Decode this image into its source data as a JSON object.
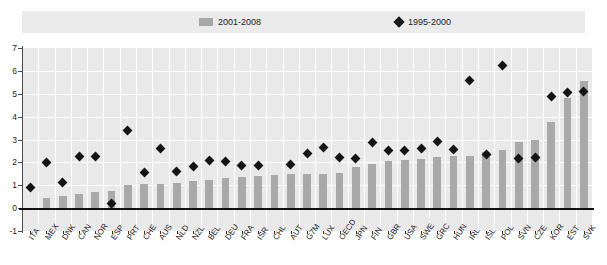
{
  "legend": {
    "items": [
      {
        "label": "2001-2008",
        "marker": "bar-swatch-icon",
        "color": "#a8a8a8"
      },
      {
        "label": "1995-2000",
        "marker": "diamond-icon",
        "color": "#1a1a1a"
      }
    ]
  },
  "chart_data": {
    "type": "bar",
    "title": "",
    "subtitle": "",
    "xlabel": "",
    "ylabel": "",
    "ylim": [
      -1,
      7
    ],
    "yticks": [
      -1,
      0,
      1,
      2,
      3,
      4,
      5,
      6,
      7
    ],
    "ytick_labels": [
      "-1",
      "0",
      "1",
      "2",
      "3",
      "4",
      "5",
      "6",
      "7"
    ],
    "grid": true,
    "legend_position": "top",
    "categories": [
      "ITA",
      "MEX",
      "DNK",
      "CAN",
      "NOR",
      "ESP",
      "PRT",
      "CHE",
      "AUS",
      "NLD",
      "NZL",
      "BEL",
      "DEU",
      "FRA",
      "ISR",
      "CHL",
      "AUT",
      "G7M",
      "LUX",
      "OECD",
      "JPN",
      "FIN",
      "GBR",
      "USA",
      "SWE",
      "GRC",
      "HUN",
      "IRL",
      "ISL",
      "POL",
      "SVN",
      "CZE",
      "KOR",
      "EST",
      "SVK"
    ],
    "series": [
      {
        "name": "2001-2008",
        "type": "bar",
        "color": "#a9a9a9",
        "values": [
          0.0,
          0.45,
          0.55,
          0.6,
          0.7,
          0.75,
          1.0,
          1.05,
          1.05,
          1.1,
          1.2,
          1.25,
          1.3,
          1.35,
          1.4,
          1.45,
          1.5,
          1.5,
          1.5,
          1.55,
          1.8,
          1.95,
          2.05,
          2.1,
          2.15,
          2.25,
          2.3,
          2.3,
          2.45,
          2.55,
          2.9,
          3.0,
          3.75,
          4.8,
          5.55
        ]
      },
      {
        "name": "1995-2000",
        "type": "scatter",
        "marker": "diamond",
        "color": "#141414",
        "values": [
          0.9,
          2.0,
          1.1,
          2.25,
          2.25,
          0.2,
          3.4,
          1.55,
          2.6,
          1.6,
          1.8,
          2.1,
          2.05,
          1.85,
          1.85,
          null,
          1.9,
          2.4,
          2.65,
          2.2,
          2.15,
          2.85,
          2.5,
          2.5,
          2.6,
          2.9,
          2.55,
          5.6,
          2.35,
          6.25,
          2.15,
          2.2,
          4.9,
          5.05,
          5.1
        ]
      }
    ]
  }
}
